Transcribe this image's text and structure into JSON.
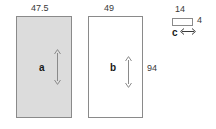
{
  "diagram": {
    "type": "technical-dimension-diagram",
    "background_color": "#ffffff",
    "line_color": "#8a8a8a",
    "fill_color_shaded": "#dcdcdc",
    "fill_color_plain": "#ffffff",
    "text_color": "#3a3a3a",
    "panels": [
      {
        "id": "a",
        "label": "a",
        "fill": "shaded",
        "width_label": "47.5",
        "height_label": "",
        "arrow": "vertical-double-headed"
      },
      {
        "id": "b",
        "label": "b",
        "fill": "plain",
        "width_label": "49",
        "height_label": "94",
        "arrow": "vertical-double-headed"
      },
      {
        "id": "c",
        "label": "c",
        "fill": "plain",
        "width_label": "14",
        "height_label": "4",
        "arrow": "horizontal-double-headed"
      }
    ]
  }
}
